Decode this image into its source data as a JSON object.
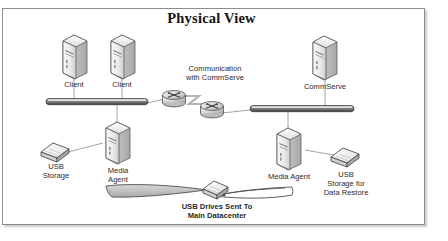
{
  "diagram": {
    "title": "Physical View",
    "frame": {
      "border_color": "#8c8c8c",
      "background": "#ffffff"
    },
    "colors": {
      "icon_light": "#f2f2f2",
      "icon_mid": "#cfcfcf",
      "icon_dark": "#9a9a9a",
      "outline": "#4a4a4a",
      "line": "#8a8a8a",
      "text": "#2b2b2b",
      "title_text": "#141414",
      "arrow_fill": "#b9b9b9"
    },
    "nodes": [
      {
        "id": "client-1",
        "type": "server",
        "label": "Client"
      },
      {
        "id": "client-2",
        "type": "server",
        "label": "Client"
      },
      {
        "id": "router-1",
        "type": "router",
        "label": ""
      },
      {
        "id": "router-2",
        "type": "router",
        "label": ""
      },
      {
        "id": "commserve",
        "type": "server",
        "label": "CommServe"
      },
      {
        "id": "media-agent-left",
        "type": "server",
        "label": "Media\nAgent"
      },
      {
        "id": "media-agent-right",
        "type": "server",
        "label": "Media Agent"
      },
      {
        "id": "usb-storage-left",
        "type": "usb-drive",
        "label": "USB\nStorage"
      },
      {
        "id": "usb-storage-right",
        "type": "usb-drive",
        "label": "USB\nStorage for\nData Restore"
      },
      {
        "id": "usb-drive-transit",
        "type": "usb-drive",
        "label": ""
      },
      {
        "id": "network-bar-left",
        "type": "network-bar",
        "label": ""
      },
      {
        "id": "network-bar-right",
        "type": "network-bar",
        "label": ""
      }
    ],
    "annotations": [
      {
        "id": "communication-label",
        "text": "Communication\nwith CommServe"
      },
      {
        "id": "transit-label",
        "text": "USB Drives Sent To\nMain Datacenter"
      }
    ]
  }
}
